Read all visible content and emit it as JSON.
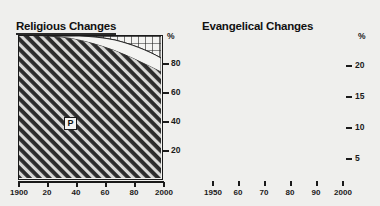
{
  "chart_data": [
    {
      "type": "area",
      "title": "Religious Changes",
      "xlabel": "",
      "ylabel": "%",
      "xlim": [
        1900,
        2000
      ],
      "ylim": [
        0,
        100
      ],
      "xticks": [
        1900,
        1920,
        1940,
        1960,
        1980,
        2000
      ],
      "xticklabels": [
        "1900",
        "20",
        "40",
        "60",
        "80",
        "2000"
      ],
      "yticks": [
        20,
        40,
        60,
        80
      ],
      "yticklabels": [
        "20",
        "40",
        "60",
        "80"
      ],
      "y_axis_unit_label": "%",
      "grid": false,
      "legend": "none",
      "annotations": [
        {
          "text": "P",
          "x": 1942,
          "y": 42,
          "style": "boxed-label"
        }
      ],
      "series": [
        {
          "name": "P",
          "fill": "diagonal-hatch-dark",
          "x": [
            1900,
            1920,
            1940,
            1950,
            1960,
            1970,
            1980,
            1990,
            2000
          ],
          "values": [
            100,
            100,
            99,
            98,
            96,
            93,
            88,
            82,
            76
          ]
        },
        {
          "name": "unlabeled-white-band",
          "fill": "solid-white",
          "x": [
            1900,
            1920,
            1940,
            1950,
            1960,
            1970,
            1980,
            1990,
            2000
          ],
          "values": [
            0,
            0,
            1,
            2,
            3,
            5,
            7,
            9,
            11
          ]
        },
        {
          "name": "unlabeled-grid-band",
          "fill": "cross-hatch-grid",
          "x": [
            1900,
            1920,
            1940,
            1950,
            1960,
            1970,
            1980,
            1990,
            2000
          ],
          "values": [
            0,
            0,
            0,
            0,
            1,
            2,
            5,
            9,
            13
          ]
        }
      ]
    },
    {
      "type": "line",
      "title": "Evangelical Changes",
      "xlabel": "",
      "ylabel": "%",
      "xlim": [
        1945,
        2000
      ],
      "ylim": [
        0,
        23
      ],
      "xticks": [
        1950,
        1960,
        1970,
        1980,
        1990,
        2000
      ],
      "xticklabels": [
        "1950",
        "60",
        "70",
        "80",
        "90",
        "2000"
      ],
      "yticks": [
        5,
        10,
        15,
        20
      ],
      "yticklabels": [
        "5",
        "10",
        "15",
        "20"
      ],
      "y_axis_unit_label": "%",
      "grid": false,
      "legend": "none",
      "annotations": [
        {
          "text": "",
          "x": 1986,
          "style": "vertical-dashed-line"
        }
      ],
      "series": [
        {
          "name": "Evangelical share",
          "style": "solid-line",
          "x": [
            1945,
            1950,
            1955,
            1958,
            1960,
            1962,
            1963,
            1965,
            1970,
            1975,
            1980,
            1985,
            1986,
            1990,
            1995,
            1998,
            2000
          ],
          "values": [
            9.8,
            10.5,
            11.6,
            12.6,
            14.0,
            15.3,
            15.7,
            15.9,
            16.2,
            16.6,
            17.3,
            18.3,
            18.5,
            19.6,
            20.6,
            21.1,
            21.4
          ]
        }
      ]
    }
  ],
  "panels": {
    "left": {
      "title": "Religious Changes",
      "y_unit": "%",
      "yticklabels": [
        "80",
        "60",
        "40",
        "20"
      ],
      "xticklabels": [
        "1900",
        "20",
        "40",
        "60",
        "80",
        "2000"
      ],
      "region_label": "P"
    },
    "right": {
      "title": "Evangelical Changes",
      "y_unit": "%",
      "yticklabels": [
        "20",
        "15",
        "10",
        "5"
      ],
      "xticklabels": [
        "1950",
        "60",
        "70",
        "80",
        "90",
        "2000"
      ]
    }
  }
}
